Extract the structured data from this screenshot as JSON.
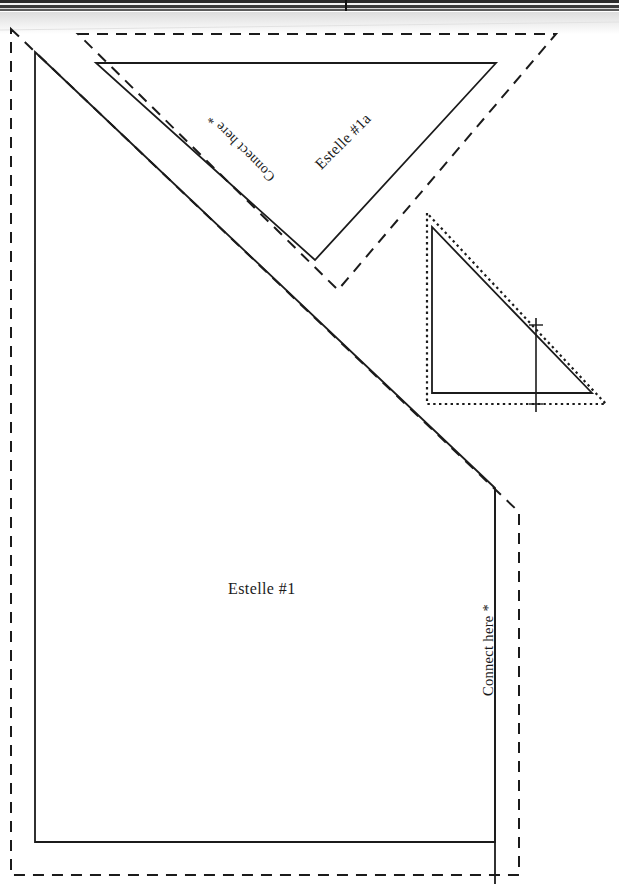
{
  "document": {
    "kind": "scanned-sewing-pattern-template",
    "width": 619,
    "height": 884,
    "background_color": "#ffffff",
    "line_color": "#1b1b1b",
    "scan_edge_color": "#2a2a2a"
  },
  "labels": {
    "estelle_1": "Estelle #1",
    "estelle_1a": "Estelle #1a",
    "connect_here_right": "Connect here *",
    "connect_here_diagonal": "Connect here *"
  },
  "pieces": [
    {
      "id": "estelle-1",
      "name": "Estelle #1",
      "outline_type": "solid",
      "seam_allowance_type": "dashed",
      "cut_line_points": "35,52 495,488 495,842 35,842",
      "seam_line_points": "11,29 519,512 519,875 11,875"
    },
    {
      "id": "estelle-1a",
      "name": "Estelle #1a",
      "outline_type": "solid",
      "seam_allowance_type": "dashed",
      "cut_line_points": "96,63 496,63 315,260",
      "seam_line_points": "78,34 556,34 338,290"
    },
    {
      "id": "small-reference-triangle",
      "name": "Small reference triangle",
      "outline_type": "solid",
      "seam_allowance_type": "dotted",
      "cut_line_points": "432,227 432,393 592,393",
      "seam_line_points": "427,213 427,404 606,404",
      "grainline": {
        "x": 536,
        "y_top": 318,
        "y_bottom": 412
      }
    }
  ],
  "marks": {
    "asterisk": "*",
    "crosshair_top": {
      "x": 536,
      "y": 325
    },
    "crosshair_bottom": {
      "x": 536,
      "y": 404
    }
  }
}
